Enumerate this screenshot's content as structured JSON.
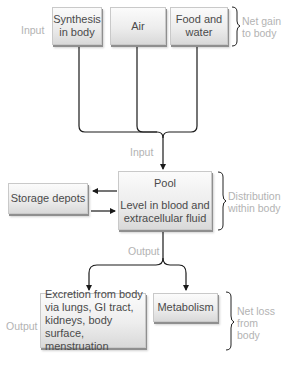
{
  "input_section": {
    "side_label": "Input",
    "sources": [
      {
        "label_line1": "Synthesis",
        "label_line2": "in body"
      },
      {
        "label_line1": "Air",
        "label_line2": ""
      },
      {
        "label_line1": "Food and",
        "label_line2": "water"
      }
    ],
    "brace_label_line1": "Net gain",
    "brace_label_line2": "to body"
  },
  "input_flow_label": "Input",
  "pool": {
    "title": "Pool",
    "desc_line1": "Level in blood and",
    "desc_line2": "extracellular fluid",
    "brace_label_line1": "Distribution",
    "brace_label_line2": "within body"
  },
  "storage": {
    "label": "Storage depots"
  },
  "output_flow_label": "Output",
  "output_section": {
    "side_label": "Output",
    "excretion": {
      "line1": "Excretion from body",
      "line2": "via lungs, GI tract,",
      "line3": "kidneys, body surface,",
      "line4": "menstruation"
    },
    "metabolism": {
      "label": "Metabolism"
    },
    "brace_label_line1": "Net loss",
    "brace_label_line2": "from",
    "brace_label_line3": "body"
  },
  "colors": {
    "line": "#1a1a1a",
    "label_gray": "#b3b3b3",
    "box_text": "#4a4a4a"
  }
}
